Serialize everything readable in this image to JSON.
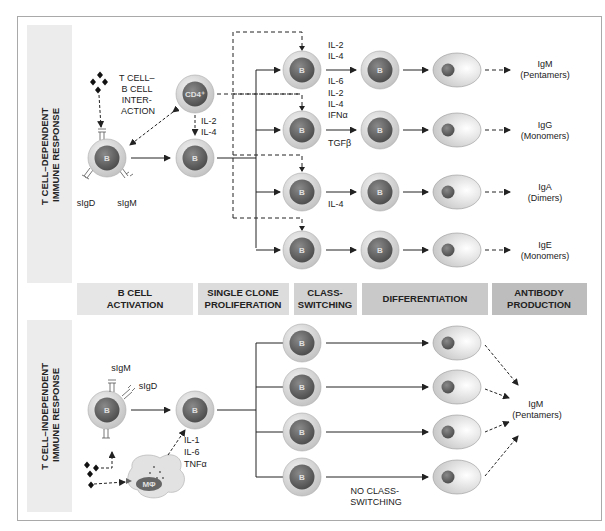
{
  "panels": {
    "top": {
      "title_line1": "T CELL–DEPENDENT",
      "title_line2": "IMMUNE RESPONSE",
      "interaction_label": [
        "T CELL–",
        "B CELL",
        "INTER-",
        "ACTION"
      ],
      "helper_cell": "CD4⁺",
      "helper_cytokines": [
        "IL-2",
        "IL-4"
      ],
      "receptors": [
        "sIgD",
        "sIgM"
      ],
      "cell_label": "B",
      "rows": [
        {
          "cytokines_above": [
            "IL-2",
            "IL-4"
          ],
          "cytokines_below": [
            "IL-6"
          ],
          "antibody": "IgM",
          "form": "(Pentamers)"
        },
        {
          "cytokines_above": [
            "IL-2",
            "IL-4",
            "IFNα"
          ],
          "cytokines_below": [
            "TGFβ"
          ],
          "antibody": "IgG",
          "form": "(Monomers)"
        },
        {
          "cytokines_above": [],
          "cytokines_below": [
            "IL-4"
          ],
          "antibody": "IgA",
          "form": "(Dimers)"
        },
        {
          "cytokines_above": [],
          "cytokines_below": [],
          "antibody": "IgE",
          "form": "(Monomers)"
        }
      ]
    },
    "stages": [
      {
        "line1": "B CELL",
        "line2": "ACTIVATION",
        "color": "#e6e6e6"
      },
      {
        "line1": "SINGLE CLONE",
        "line2": "PROLIFERATION",
        "color": "#dcdcdc"
      },
      {
        "line1": "CLASS-",
        "line2": "SWITCHING",
        "color": "#d2d2d2"
      },
      {
        "line1": "DIFFERENTIATION",
        "line2": "",
        "color": "#c9c9c9"
      },
      {
        "line1": "ANTIBODY",
        "line2": "PRODUCTION",
        "color": "#bdbdbd"
      }
    ],
    "bottom": {
      "title_line1": "T CELL–INDEPENDENT",
      "title_line2": "IMMUNE RESPONSE",
      "receptors": [
        "sIgM",
        "sIgD"
      ],
      "macrophage": "MΦ",
      "cytokines": [
        "IL-1",
        "IL-6",
        "TNFα"
      ],
      "cell_label": "B",
      "no_switch_label": [
        "NO CLASS-",
        "SWITCHING"
      ],
      "antibody": "IgM",
      "form": "(Pentamers)"
    }
  },
  "colors": {
    "cell_ring": "#d9d9d9",
    "nucleus": "#6e6e6e",
    "side_band": "#ececec",
    "line": "#222222"
  }
}
